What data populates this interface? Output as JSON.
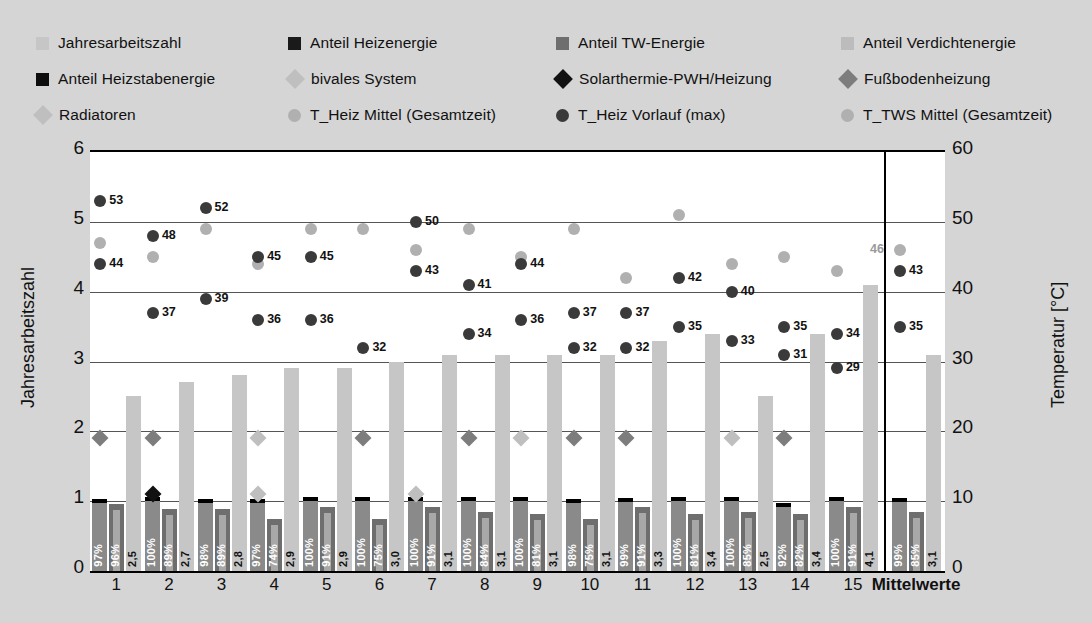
{
  "legend": {
    "rows": [
      [
        {
          "label": "Jahresarbeitszahl",
          "marker": "square",
          "color": "#c6c6c6",
          "x": 0
        },
        {
          "label": "Anteil Heizenergie",
          "marker": "square",
          "color": "#1a1a1a",
          "x": 252
        },
        {
          "label": "Anteil TW-Energie",
          "marker": "square",
          "color": "#6e6e6e",
          "x": 520
        },
        {
          "label": "Anteil Verdichtenergie",
          "marker": "square",
          "color": "#bcbcbc",
          "x": 805
        }
      ],
      [
        {
          "label": "Anteil Heizstabenergie",
          "marker": "square",
          "color": "#0d0d0d",
          "x": 0
        },
        {
          "label": "bivales System",
          "marker": "diamond",
          "color": "#bfbfbf",
          "x": 252
        },
        {
          "label": "Solarthermie-PWH/Heizung",
          "marker": "diamond",
          "color": "#111111",
          "x": 520
        },
        {
          "label": "Fußbodenheizung",
          "marker": "diamond",
          "color": "#7d7d7d",
          "x": 805
        }
      ],
      [
        {
          "label": "Radiatoren",
          "marker": "diamond",
          "color": "#bfbfbf",
          "x": 0
        },
        {
          "label": "T_Heiz Mittel (Gesamtzeit)",
          "marker": "circle",
          "color": "#b0b0b0",
          "x": 252
        },
        {
          "label": "T_Heiz Vorlauf (max)",
          "marker": "circle",
          "color": "#3a3a3a",
          "x": 520
        },
        {
          "label": "T_TWS Mittel (Gesamtzeit)",
          "marker": "circle",
          "color": "#b0b0b0",
          "x": 805
        }
      ]
    ]
  },
  "axes": {
    "left_title": "Jahresarbeitszahl",
    "right_title": "Temperatur [°C]",
    "left_ticks": [
      "6",
      "5",
      "4",
      "3",
      "2",
      "1",
      "0"
    ],
    "right_ticks": [
      "60",
      "50",
      "40",
      "30",
      "20",
      "10",
      "0"
    ],
    "left_range": [
      0,
      6
    ],
    "right_range": [
      0,
      60
    ]
  },
  "chart_data": {
    "type": "bar",
    "title": "",
    "xlabel": "",
    "ylabel": "Jahresarbeitszahl",
    "y2label": "Temperatur [°C]",
    "ylim": [
      0,
      6
    ],
    "y2lim": [
      0,
      60
    ],
    "grid": true,
    "legend_position": "top",
    "categories": [
      "1",
      "2",
      "3",
      "4",
      "5",
      "6",
      "7",
      "8",
      "9",
      "10",
      "11",
      "12",
      "13",
      "14",
      "15",
      "Mittelwerte"
    ],
    "series": [
      {
        "name": "Anteil Heizenergie",
        "unit": "%",
        "axis": "left-scaled",
        "labels": [
          "97%",
          "100%",
          "98%",
          "97%",
          "100%",
          "100%",
          "100%",
          "100%",
          "100%",
          "98%",
          "99%",
          "100%",
          "100%",
          "92%",
          "100%",
          "99%"
        ],
        "values": [
          97,
          100,
          98,
          97,
          100,
          100,
          100,
          100,
          100,
          98,
          99,
          100,
          100,
          92,
          100,
          99
        ]
      },
      {
        "name": "Anteil TW-Energie",
        "unit": "%",
        "axis": "left-scaled",
        "labels": [
          "96%",
          "89%",
          "89%",
          "74%",
          "91%",
          "75%",
          "91%",
          "84%",
          "81%",
          "75%",
          "91%",
          "81%",
          "85%",
          "82%",
          "91%",
          "85%"
        ],
        "values": [
          96,
          89,
          89,
          74,
          91,
          75,
          91,
          84,
          81,
          75,
          91,
          81,
          85,
          82,
          91,
          85
        ]
      },
      {
        "name": "Jahresarbeitszahl",
        "unit": "",
        "axis": "left",
        "labels": [
          "2,5",
          "2,7",
          "2,8",
          "2,9",
          "2,9",
          "3,0",
          "3,1",
          "3,1",
          "3,1",
          "3,1",
          "3,3",
          "3,4",
          "2,5",
          "3,4",
          "4,1",
          "3,1"
        ],
        "values": [
          2.5,
          2.7,
          2.8,
          2.9,
          2.9,
          3.0,
          3.1,
          3.1,
          3.1,
          3.1,
          3.3,
          3.4,
          2.5,
          3.4,
          4.1,
          3.1
        ]
      },
      {
        "name": "T_Heiz Vorlauf (max)",
        "unit": "°C",
        "axis": "right",
        "labels": [
          "53",
          "48",
          "52",
          "45",
          "45",
          "50",
          "43",
          "41",
          "44",
          "42",
          "40",
          "35",
          "43"
        ],
        "values": [
          53,
          48,
          52,
          45,
          45,
          50,
          43,
          41,
          44,
          42,
          40,
          null,
          null,
          35,
          null,
          43
        ]
      },
      {
        "name": "T_Heiz Mittel (Gesamtzeit)",
        "unit": "°C",
        "axis": "right",
        "values": [
          44,
          37,
          39,
          36,
          36,
          32,
          34,
          36,
          37,
          32,
          37,
          32,
          35,
          33,
          31,
          35
        ]
      },
      {
        "name": "T_TWS Mittel (Gesamtzeit)",
        "unit": "°C",
        "axis": "right",
        "values": [
          47,
          45,
          49,
          44,
          49,
          49,
          46,
          49,
          45,
          49,
          42,
          51,
          44,
          45,
          43,
          46
        ]
      }
    ],
    "point_labels_dark": [
      {
        "g": 1,
        "v": "53"
      },
      {
        "g": 2,
        "v": "48"
      },
      {
        "g": 3,
        "v": "52"
      },
      {
        "g": 4,
        "v": "45"
      },
      {
        "g": 5,
        "v": "45"
      },
      {
        "g": 7,
        "v": "50"
      },
      {
        "g": 7,
        "v": "43"
      },
      {
        "g": 8,
        "v": "41"
      },
      {
        "g": 9,
        "v": "44"
      },
      {
        "g": 12,
        "v": "42"
      },
      {
        "g": 13,
        "v": "40"
      },
      {
        "g": 15,
        "v": "35"
      },
      {
        "g": 16,
        "v": "43"
      },
      {
        "g": 1,
        "v": "44"
      },
      {
        "g": 2,
        "v": "37"
      },
      {
        "g": 3,
        "v": "39"
      },
      {
        "g": 4,
        "v": "36"
      },
      {
        "g": 5,
        "v": "36"
      },
      {
        "g": 6,
        "v": "32"
      },
      {
        "g": 8,
        "v": "34"
      },
      {
        "g": 9,
        "v": "36"
      },
      {
        "g": 10,
        "v": "37"
      },
      {
        "g": 10,
        "v": "32"
      },
      {
        "g": 11,
        "v": "37"
      },
      {
        "g": 11,
        "v": "32"
      },
      {
        "g": 12,
        "v": "35"
      },
      {
        "g": 13,
        "v": "33"
      },
      {
        "g": 14,
        "v": "35"
      },
      {
        "g": 14,
        "v": "31"
      },
      {
        "g": 15,
        "v": "34"
      },
      {
        "g": 15,
        "v": "29"
      },
      {
        "g": 16,
        "v": "35"
      }
    ],
    "point_label_grey": {
      "g": 16,
      "v": "46"
    }
  },
  "points": {
    "vorlauf": [
      {
        "i": 0,
        "t": 53,
        "lab": "53"
      },
      {
        "i": 1,
        "t": 48,
        "lab": "48"
      },
      {
        "i": 2,
        "t": 52,
        "lab": "52"
      },
      {
        "i": 3,
        "t": 45,
        "lab": "45"
      },
      {
        "i": 4,
        "t": 45,
        "lab": "45"
      },
      {
        "i": 5,
        "t": null,
        "lab": ""
      },
      {
        "i": 6,
        "t": 50,
        "lab": "50"
      },
      {
        "i": 7,
        "t": 41,
        "lab": "41"
      },
      {
        "i": 8,
        "t": 44,
        "lab": "44"
      },
      {
        "i": 9,
        "t": 37,
        "lab": "37"
      },
      {
        "i": 10,
        "t": 37,
        "lab": "37"
      },
      {
        "i": 11,
        "t": 42,
        "lab": "42"
      },
      {
        "i": 12,
        "t": 40,
        "lab": "40"
      },
      {
        "i": 13,
        "t": 35,
        "lab": "35"
      },
      {
        "i": 14,
        "t": 34,
        "lab": "34"
      },
      {
        "i": 15,
        "t": 43,
        "lab": "43"
      }
    ],
    "heizmittel": [
      {
        "i": 0,
        "t": 44,
        "lab": "44"
      },
      {
        "i": 1,
        "t": 37,
        "lab": "37"
      },
      {
        "i": 2,
        "t": 39,
        "lab": "39"
      },
      {
        "i": 3,
        "t": 36,
        "lab": "36"
      },
      {
        "i": 4,
        "t": 36,
        "lab": "36"
      },
      {
        "i": 5,
        "t": 32,
        "lab": "32"
      },
      {
        "i": 6,
        "t": 43,
        "lab": "43"
      },
      {
        "i": 7,
        "t": 34,
        "lab": "34"
      },
      {
        "i": 8,
        "t": 36,
        "lab": "36"
      },
      {
        "i": 9,
        "t": 32,
        "lab": "32"
      },
      {
        "i": 10,
        "t": 32,
        "lab": "32"
      },
      {
        "i": 11,
        "t": 35,
        "lab": "35"
      },
      {
        "i": 12,
        "t": 33,
        "lab": "33"
      },
      {
        "i": 13,
        "t": 31,
        "lab": "31"
      },
      {
        "i": 14,
        "t": 29,
        "lab": "29"
      },
      {
        "i": 15,
        "t": 35,
        "lab": "35"
      }
    ],
    "twsmittel": [
      {
        "i": 0,
        "t": 47
      },
      {
        "i": 1,
        "t": 45
      },
      {
        "i": 2,
        "t": 49
      },
      {
        "i": 3,
        "t": 44
      },
      {
        "i": 4,
        "t": 49
      },
      {
        "i": 5,
        "t": 49
      },
      {
        "i": 6,
        "t": 46
      },
      {
        "i": 7,
        "t": 49
      },
      {
        "i": 8,
        "t": 45
      },
      {
        "i": 9,
        "t": 49
      },
      {
        "i": 10,
        "t": 42
      },
      {
        "i": 11,
        "t": 51
      },
      {
        "i": 12,
        "t": 44
      },
      {
        "i": 13,
        "t": 45
      },
      {
        "i": 14,
        "t": 43
      },
      {
        "i": 15,
        "t": 46,
        "lab": "46"
      }
    ],
    "diamonds_high": [
      {
        "i": 0,
        "kind": "dark"
      },
      {
        "i": 1,
        "kind": "dark"
      },
      {
        "i": 5,
        "kind": "dark"
      },
      {
        "i": 7,
        "kind": "dark"
      },
      {
        "i": 9,
        "kind": "dark"
      },
      {
        "i": 10,
        "kind": "dark"
      },
      {
        "i": 13,
        "kind": "dark"
      },
      {
        "i": 3,
        "kind": "light"
      },
      {
        "i": 8,
        "kind": "light"
      },
      {
        "i": 12,
        "kind": "light"
      }
    ],
    "diamonds_low": [
      {
        "i": 1,
        "kind": "black"
      },
      {
        "i": 3,
        "kind": "light"
      },
      {
        "i": 6,
        "kind": "light"
      }
    ]
  }
}
